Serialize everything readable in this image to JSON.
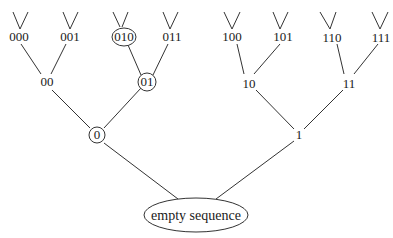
{
  "diagram": {
    "type": "binary-tree",
    "root": {
      "label": "empty sequence",
      "shape": "ellipse"
    },
    "level1": [
      {
        "label": "0",
        "circled": true
      },
      {
        "label": "1",
        "circled": false
      }
    ],
    "level2": [
      {
        "label": "00",
        "circled": false
      },
      {
        "label": "01",
        "circled": true
      },
      {
        "label": "10",
        "circled": false
      },
      {
        "label": "11",
        "circled": false
      }
    ],
    "level3": [
      {
        "label": "000",
        "circled": false
      },
      {
        "label": "001",
        "circled": false
      },
      {
        "label": "010",
        "circled": true
      },
      {
        "label": "011",
        "circled": false
      },
      {
        "label": "100",
        "circled": false
      },
      {
        "label": "101",
        "circled": false
      },
      {
        "label": "110",
        "circled": false
      },
      {
        "label": "111",
        "circled": false
      }
    ],
    "colors": {
      "line": "#333333",
      "text": "#1a1a1a",
      "background": "#ffffff"
    }
  }
}
